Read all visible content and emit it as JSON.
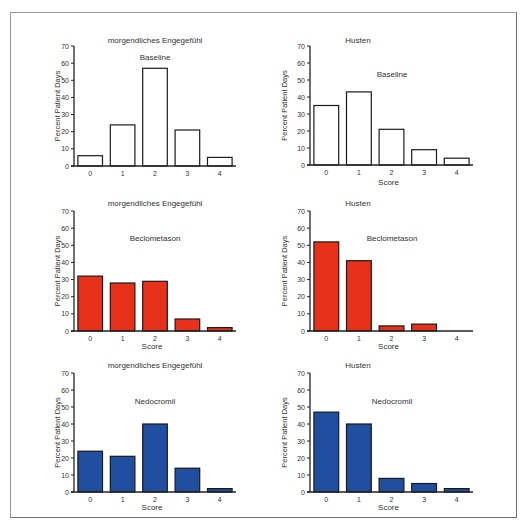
{
  "figure": {
    "frame_color": "#8a8a8a"
  },
  "chart_data": [
    {
      "type": "bar",
      "title": "morgendliches Engegefühl",
      "subtitle": "Baseline",
      "xlabel": "",
      "ylabel": "Percent Patient Days",
      "categories": [
        "0",
        "1",
        "2",
        "3",
        "4"
      ],
      "values": [
        6,
        24,
        57,
        21,
        5
      ],
      "ylim": [
        0,
        70
      ],
      "yticks": [
        0,
        10,
        20,
        30,
        40,
        50,
        60,
        70
      ],
      "bar_color": "#ffffff",
      "grid": false
    },
    {
      "type": "bar",
      "title": "Husten",
      "subtitle": "Baseline",
      "xlabel": "Score",
      "ylabel": "Percent Patient Days",
      "categories": [
        "0",
        "1",
        "2",
        "3",
        "4"
      ],
      "values": [
        35,
        43,
        21,
        9,
        4
      ],
      "ylim": [
        0,
        70
      ],
      "yticks": [
        0,
        10,
        20,
        30,
        40,
        50,
        60,
        70
      ],
      "bar_color": "#ffffff",
      "grid": false
    },
    {
      "type": "bar",
      "title": "morgendliches Engegefühl",
      "subtitle": "Beclometason",
      "xlabel": "Score",
      "ylabel": "Percent Patient Days",
      "categories": [
        "0",
        "1",
        "2",
        "3",
        "4"
      ],
      "values": [
        32,
        28,
        29,
        7,
        2
      ],
      "ylim": [
        0,
        70
      ],
      "yticks": [
        0,
        10,
        20,
        30,
        40,
        50,
        60,
        70
      ],
      "bar_color": "#e8311a",
      "grid": false
    },
    {
      "type": "bar",
      "title": "Husten",
      "subtitle": "Beclometason",
      "xlabel": "Score",
      "ylabel": "Percent Patient Days",
      "categories": [
        "0",
        "1",
        "2",
        "3",
        "4"
      ],
      "values": [
        52,
        41,
        3,
        4,
        0
      ],
      "ylim": [
        0,
        70
      ],
      "yticks": [
        0,
        10,
        20,
        30,
        40,
        50,
        60,
        70
      ],
      "bar_color": "#e8311a",
      "grid": false
    },
    {
      "type": "bar",
      "title": "morgendliches Engegefühl",
      "subtitle": "Nedocromil",
      "xlabel": "Score",
      "ylabel": "Percent Patient Days",
      "categories": [
        "0",
        "1",
        "2",
        "3",
        "4"
      ],
      "values": [
        24,
        21,
        40,
        14,
        2
      ],
      "ylim": [
        0,
        70
      ],
      "yticks": [
        0,
        10,
        20,
        30,
        40,
        50,
        60,
        70
      ],
      "bar_color": "#1f4f9e",
      "grid": false
    },
    {
      "type": "bar",
      "title": "Husten",
      "subtitle": "Nedocromil",
      "xlabel": "Score",
      "ylabel": "Percent Patient Days",
      "categories": [
        "0",
        "1",
        "2",
        "3",
        "4"
      ],
      "values": [
        47,
        40,
        8,
        5,
        2
      ],
      "ylim": [
        0,
        70
      ],
      "yticks": [
        0,
        10,
        20,
        30,
        40,
        50,
        60,
        70
      ],
      "bar_color": "#1f4f9e",
      "grid": false
    }
  ]
}
